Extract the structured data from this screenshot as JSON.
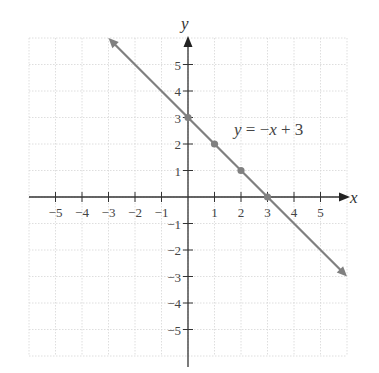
{
  "chart_data": {
    "type": "line",
    "title": "",
    "xlabel": "x",
    "ylabel": "y",
    "xlim": [
      -6,
      6
    ],
    "ylim": [
      -6,
      6
    ],
    "grid": true,
    "x_ticks": [
      -5,
      -4,
      -3,
      -2,
      -1,
      1,
      2,
      3,
      4,
      5
    ],
    "y_ticks": [
      -5,
      -4,
      -3,
      -2,
      -1,
      1,
      2,
      3,
      4,
      5
    ],
    "x_tick_labels": [
      "−5",
      "−4",
      "−3",
      "−2",
      "−1",
      "1",
      "2",
      "3",
      "4",
      "5"
    ],
    "y_tick_labels": [
      "−5",
      "−4",
      "−3",
      "−2",
      "−1",
      "1",
      "2",
      "3",
      "4",
      "5"
    ],
    "series": [
      {
        "name": "y = −x + 3",
        "equation": "y = −x + 3",
        "slope": -1,
        "intercept": 3,
        "line_from": [
          -3,
          6
        ],
        "line_to": [
          6,
          -3
        ],
        "arrows_both_ends": true,
        "points": [
          [
            0,
            3
          ],
          [
            1,
            2
          ],
          [
            2,
            1
          ],
          [
            3,
            0
          ]
        ],
        "color": "#808080"
      }
    ],
    "annotations": [
      {
        "text": "y = −x + 3",
        "x": 2.6,
        "y": 2.7
      }
    ]
  },
  "labels": {
    "x_axis": "x",
    "y_axis": "y",
    "equation_italic_y": "y",
    "equation_eq": " = −",
    "equation_italic_x": "x",
    "equation_rest": " + 3"
  }
}
